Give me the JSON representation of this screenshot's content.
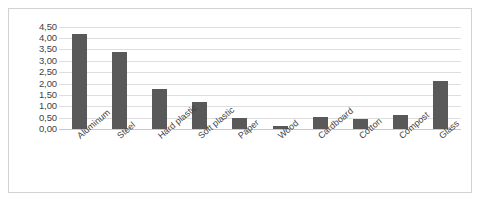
{
  "chart_data": {
    "type": "bar",
    "title": "",
    "subtitle": "",
    "xlabel": "",
    "ylabel": "",
    "categories": [
      "Aluminum",
      "Steel",
      "Hard plastic",
      "Soft plastic",
      "Paper",
      "Wood",
      "Cardboard",
      "Cotton",
      "Compost",
      "Glass"
    ],
    "values": [
      4.2,
      3.4,
      1.75,
      1.2,
      0.5,
      0.15,
      0.55,
      0.45,
      0.6,
      2.1
    ],
    "value_labels": [
      "4,20",
      "3,40",
      "1,75",
      "1,20",
      "0,50",
      "0,15",
      "0,55",
      "0,45",
      "0,60",
      "2,10"
    ],
    "ylim": [
      0,
      4.75
    ],
    "ytick_values": [
      4.5,
      4.0,
      3.5,
      3.0,
      2.5,
      2.0,
      1.5,
      1.0,
      0.5,
      0.0
    ],
    "ytick_labels": [
      "4,50",
      "4,00",
      "3,50",
      "3,00",
      "2,50",
      "2,00",
      "1,50",
      "1,00",
      "0,50",
      "0,00"
    ],
    "decimal_separator": ",",
    "grid": true,
    "grid_orientation": "horizontal",
    "legend": false,
    "legend_position": "none",
    "series": [
      {
        "name": "",
        "values": [
          4.2,
          3.4,
          1.75,
          1.2,
          0.5,
          0.15,
          0.55,
          0.45,
          0.6,
          2.1
        ]
      }
    ]
  },
  "style": {
    "bar_color": "#595959",
    "gridline_color": "#dedede",
    "baseline_color": "#c9c9c9",
    "frame_color": "#d2d2d2",
    "text_color": "#3f3f3f",
    "background": "#ffffff"
  }
}
